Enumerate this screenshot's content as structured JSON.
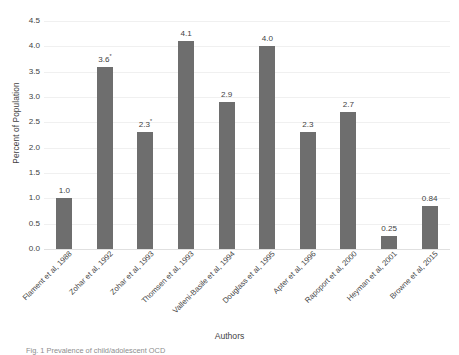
{
  "chart_data": {
    "type": "bar",
    "title": "",
    "xlabel": "Authors",
    "ylabel": "Percent of Population",
    "ylim": [
      0.0,
      4.5
    ],
    "ytick_step": 0.5,
    "grid": true,
    "legend": "none",
    "bar_color": "#6e6e6e",
    "categories": [
      "Flament et al, 1988",
      "Zohar et al, 1992",
      "Zohar et al, 1993",
      "Thomsen et al, 1993",
      "Valleni-Basile et al, 1994",
      "Douglass et al, 1995",
      "Apter et al, 1996",
      "Rapoport et al, 2000",
      "Heyman et al, 2001",
      "Browne et al, 2015"
    ],
    "values": [
      1.0,
      3.6,
      2.3,
      4.1,
      2.9,
      4.0,
      2.3,
      2.7,
      0.25,
      0.84
    ],
    "data_labels": [
      "1.0",
      "3.6",
      "2.3",
      "4.1",
      "2.9",
      "4.0",
      "2.3",
      "2.7",
      "0.25",
      "0.84"
    ],
    "data_label_marks": [
      "",
      "*",
      "*",
      "",
      "",
      "",
      "",
      "",
      "",
      ""
    ],
    "ytick_labels": [
      "4.5",
      "4.0",
      "3.5",
      "3.0",
      "2.5",
      "2.0",
      "1.5",
      "1.0",
      "0.5",
      "0.0"
    ],
    "ytick_values": [
      4.5,
      4.0,
      3.5,
      3.0,
      2.5,
      2.0,
      1.5,
      1.0,
      0.5,
      0.0
    ]
  },
  "axes": {
    "y_title": "Percent of Population",
    "x_title": "Authors"
  },
  "caption": {
    "text": "Fig. 1  Prevalence of child/adolescent OCD"
  }
}
